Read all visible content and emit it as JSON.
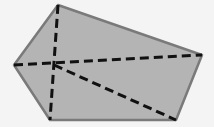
{
  "diagram": {
    "type": "pentagon-with-dashed-segments",
    "canvas": {
      "width": 214,
      "height": 127
    },
    "colors": {
      "background": "#f4f4f4",
      "fill": "#b4b4b4",
      "edge": "#7a7a7a",
      "dash": "#111111"
    },
    "vertices": [
      {
        "name": "top",
        "x": 58,
        "y": 5
      },
      {
        "name": "right",
        "x": 202,
        "y": 55
      },
      {
        "name": "bottom-right",
        "x": 176,
        "y": 120
      },
      {
        "name": "bottom-left",
        "x": 50,
        "y": 120
      },
      {
        "name": "left",
        "x": 14,
        "y": 65
      }
    ],
    "interior_point": {
      "x": 54,
      "y": 65
    },
    "dashed_segments": [
      {
        "from": {
          "x": 58,
          "y": 5
        },
        "to": {
          "x": 50,
          "y": 120
        }
      },
      {
        "from": {
          "x": 14,
          "y": 65
        },
        "to": {
          "x": 202,
          "y": 55
        }
      },
      {
        "from": {
          "x": 54,
          "y": 65
        },
        "to": {
          "x": 176,
          "y": 120
        }
      }
    ]
  }
}
